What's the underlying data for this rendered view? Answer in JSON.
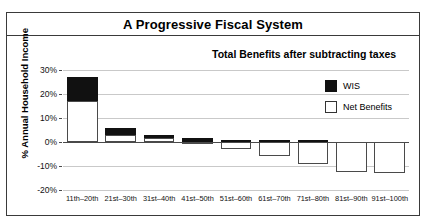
{
  "chart_title": "A Progressive Fiscal System",
  "subtitle": "Total Benefits after subtracting taxes",
  "legend": {
    "items": [
      {
        "label": "WIS",
        "swatch": "black",
        "color": "#111111"
      },
      {
        "label": "Net Benefits",
        "swatch": "white",
        "color": "#ffffff"
      }
    ]
  },
  "chart_data": {
    "type": "bar",
    "stacked": true,
    "title": "A Progressive Fiscal System",
    "subtitle": "Total Benefits after subtracting taxes",
    "xlabel": "",
    "ylabel": "% Annual Household Income",
    "ylim": [
      -20,
      30
    ],
    "yticks": [
      30,
      20,
      10,
      0,
      -10,
      -20
    ],
    "ytick_labels": [
      "30%",
      "20%",
      "10%",
      "0%",
      "-10%",
      "-20%"
    ],
    "grid": true,
    "legend_position": "top-right",
    "categories": [
      "11th–20th",
      "21st–30th",
      "31st–40th",
      "41st–50th",
      "51st–60th",
      "61st–70th",
      "71st–80th",
      "81st–90th",
      "91st–100th"
    ],
    "series": [
      {
        "name": "Net Benefits",
        "color": "#ffffff",
        "values": [
          17,
          3,
          1.5,
          -1,
          -3,
          -6,
          -9,
          -12.5,
          -13
        ]
      },
      {
        "name": "WIS",
        "color": "#111111",
        "values": [
          10,
          3,
          1.5,
          1.5,
          1,
          1,
          1,
          0,
          0
        ]
      }
    ],
    "totals": [
      27,
      6,
      3,
      0.5,
      -2,
      -5,
      -8,
      -12.5,
      -13
    ]
  }
}
